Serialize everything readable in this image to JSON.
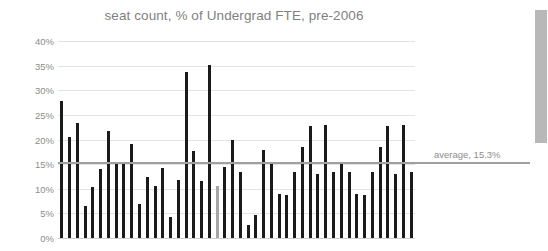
{
  "chart_data": {
    "type": "bar",
    "title": "seat count, % of Undergrad FTE, pre-2006",
    "xlabel": "",
    "ylabel": "",
    "ylim": [
      0,
      40
    ],
    "ytick_labels": [
      "40%",
      "35%",
      "30%",
      "25%",
      "20%",
      "15%",
      "10%",
      "5%",
      "0%"
    ],
    "ytick_values": [
      40,
      35,
      30,
      25,
      20,
      15,
      10,
      5,
      0
    ],
    "grid": true,
    "legend": "none",
    "categories": [
      "1",
      "2",
      "3",
      "4",
      "5",
      "6",
      "7",
      "8",
      "9",
      "10",
      "11",
      "12",
      "13",
      "14",
      "15",
      "16",
      "17",
      "18",
      "19",
      "20",
      "21",
      "22",
      "23",
      "24",
      "25",
      "26",
      "27",
      "28",
      "29",
      "30",
      "31",
      "32",
      "33",
      "34",
      "35",
      "36",
      "37",
      "38",
      "39",
      "40",
      "41",
      "42",
      "43",
      "44",
      "45",
      "46"
    ],
    "values": [
      27.8,
      20.5,
      23.3,
      6.4,
      10.3,
      14.0,
      21.7,
      15.2,
      15.0,
      19.1,
      7.0,
      12.4,
      10.5,
      14.2,
      4.2,
      11.8,
      33.8,
      17.7,
      11.6,
      35.2,
      10.5,
      14.5,
      20.0,
      13.4,
      2.7,
      4.6,
      17.8,
      15.0,
      9.0,
      8.7,
      13.5,
      18.5,
      22.8,
      12.9,
      22.9,
      13.4,
      15.0,
      13.4,
      9.0,
      8.7,
      13.5,
      18.5,
      22.8,
      12.9,
      22.9,
      13.4
    ],
    "highlight_index": 20,
    "series_color": "#1a1a1a",
    "highlight_color": "#a6a6a6",
    "average": {
      "label": "average, 15.3%",
      "value": 15.3,
      "color": "#a0a0a0"
    }
  },
  "scrollbar": {
    "orientation": "vertical",
    "thumb_color": "#b8b8b8"
  }
}
